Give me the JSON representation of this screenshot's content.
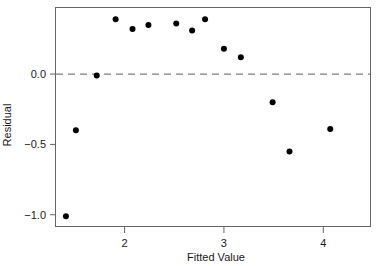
{
  "chart_data": {
    "type": "scatter",
    "title": "",
    "subtitle": "",
    "xlabel": "Fitted Value",
    "ylabel": "Residual",
    "xlim": [
      1.31,
      4.47
    ],
    "ylim": [
      -1.08,
      0.47
    ],
    "grid": false,
    "legend": null,
    "x_ticks": [
      2,
      3,
      4
    ],
    "x_tick_labels": [
      "2",
      "3",
      "4"
    ],
    "y_ticks": [
      0.0,
      -0.5,
      -1.0
    ],
    "y_tick_labels": [
      "0.0",
      "−0.5",
      "−1.0"
    ],
    "reference_line": {
      "orientation": "horizontal",
      "value": 0.0,
      "style": "dashed",
      "color": "#808080"
    },
    "point_color": "#000000",
    "point_size": 3,
    "points": [
      {
        "x": 1.41,
        "y": -1.01
      },
      {
        "x": 1.51,
        "y": -0.4
      },
      {
        "x": 1.72,
        "y": -0.01
      },
      {
        "x": 1.91,
        "y": 0.39
      },
      {
        "x": 2.08,
        "y": 0.32
      },
      {
        "x": 2.24,
        "y": 0.35
      },
      {
        "x": 2.52,
        "y": 0.36
      },
      {
        "x": 2.68,
        "y": 0.31
      },
      {
        "x": 2.81,
        "y": 0.39
      },
      {
        "x": 3.0,
        "y": 0.18
      },
      {
        "x": 3.17,
        "y": 0.12
      },
      {
        "x": 3.49,
        "y": -0.2
      },
      {
        "x": 3.66,
        "y": -0.55
      },
      {
        "x": 4.07,
        "y": -0.39
      }
    ]
  },
  "axes": {
    "frame_color": "#666666",
    "tick_color": "#666666",
    "background": "#ffffff"
  }
}
